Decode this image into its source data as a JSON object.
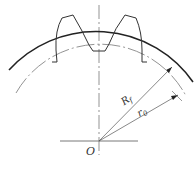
{
  "diagram": {
    "type": "gear tooth geometry",
    "labels": {
      "center": "O",
      "outer_radius": "R",
      "outer_radius_sub": "f",
      "pitch_radius": "r",
      "pitch_radius_sub": "0"
    }
  }
}
